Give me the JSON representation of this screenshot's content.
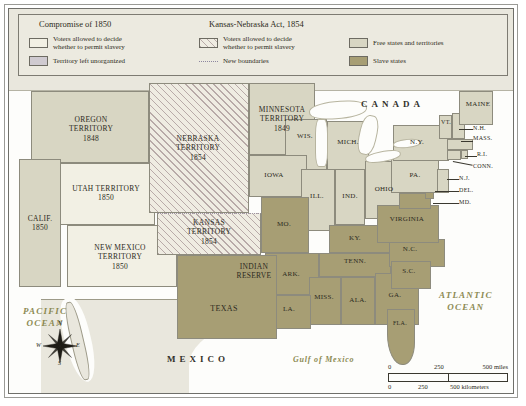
{
  "legend": {
    "titles": [
      {
        "text": "Compromise of 1850"
      },
      {
        "text": "Kansas-Nebraska Act, 1854"
      }
    ],
    "items": [
      {
        "label": "Voters allowed to decide\nwhether to permit slavery",
        "line1": "Voters allowed to decide",
        "line2": "whether to permit slavery",
        "swatch": "#f2f0e4",
        "group": "compromise"
      },
      {
        "label": "Territory left unorganized",
        "line1": "Territory left unorganized",
        "line2": "",
        "swatch": "#cfcad0",
        "group": "compromise"
      },
      {
        "label": "Voters allowed to decide\nwhether to permit slavery",
        "line1": "Voters allowed to decide",
        "line2": "whether to permit slavery",
        "swatch": "hatch",
        "group": "kansas-nebraska"
      },
      {
        "label": "New boundaries",
        "line1": "New boundaries",
        "line2": "",
        "swatch": "dashed",
        "group": "kansas-nebraska"
      },
      {
        "label": "Free states and territories",
        "line1": "Free states and territories",
        "line2": "",
        "swatch": "#d8d6c3",
        "group": "status"
      },
      {
        "label": "Slave states",
        "line1": "Slave states",
        "line2": "",
        "swatch": "#a79e74",
        "group": "status"
      }
    ]
  },
  "countries": [
    {
      "name": "CANADA"
    },
    {
      "name": "MEXICO"
    }
  ],
  "oceans": [
    {
      "line1": "PACIFIC",
      "line2": "OCEAN"
    },
    {
      "line1": "ATLANTIC",
      "line2": "OCEAN"
    },
    {
      "line1": "Gulf of Mexico",
      "line2": ""
    }
  ],
  "territories": [
    {
      "name": "OREGON TERRITORY",
      "line1": "OREGON",
      "line2": "TERRITORY",
      "year": "1848",
      "fill": "free"
    },
    {
      "name": "UTAH TERRITORY",
      "line1": "UTAH TERRITORY",
      "line2": "",
      "year": "1850",
      "fill": "voters"
    },
    {
      "name": "NEW MEXICO TERRITORY",
      "line1": "NEW MEXICO",
      "line2": "TERRITORY",
      "year": "1850",
      "fill": "voters"
    },
    {
      "name": "NEBRASKA TERRITORY",
      "line1": "NEBRASKA",
      "line2": "TERRITORY",
      "year": "1854",
      "fill": "hatch"
    },
    {
      "name": "KANSAS TERRITORY",
      "line1": "KANSAS",
      "line2": "TERRITORY",
      "year": "1854",
      "fill": "hatch"
    },
    {
      "name": "MINNESOTA TERRITORY",
      "line1": "MINNESOTA",
      "line2": "TERRITORY",
      "year": "1849",
      "fill": "free"
    },
    {
      "name": "INDIAN RESERVE",
      "line1": "INDIAN",
      "line2": "RESERVE",
      "year": "",
      "fill": "unorganized"
    }
  ],
  "states": [
    {
      "name": "CALIF.",
      "year": "1850",
      "fill": "free"
    },
    {
      "name": "TEXAS",
      "year": "",
      "fill": "slave"
    },
    {
      "name": "WIS.",
      "year": "",
      "fill": "free"
    },
    {
      "name": "MICH.",
      "year": "",
      "fill": "free"
    },
    {
      "name": "IOWA",
      "year": "",
      "fill": "free"
    },
    {
      "name": "ILL.",
      "year": "",
      "fill": "free"
    },
    {
      "name": "IND.",
      "year": "",
      "fill": "free"
    },
    {
      "name": "OHIO",
      "year": "",
      "fill": "free"
    },
    {
      "name": "MO.",
      "year": "",
      "fill": "slave"
    },
    {
      "name": "KY.",
      "year": "",
      "fill": "slave"
    },
    {
      "name": "TENN.",
      "year": "",
      "fill": "slave"
    },
    {
      "name": "ARK.",
      "year": "",
      "fill": "slave"
    },
    {
      "name": "MISS.",
      "year": "",
      "fill": "slave"
    },
    {
      "name": "ALA.",
      "year": "",
      "fill": "slave"
    },
    {
      "name": "GA.",
      "year": "",
      "fill": "slave"
    },
    {
      "name": "LA.",
      "year": "",
      "fill": "slave"
    },
    {
      "name": "FLA.",
      "year": "",
      "fill": "slave"
    },
    {
      "name": "N.C.",
      "year": "",
      "fill": "slave"
    },
    {
      "name": "S.C.",
      "year": "",
      "fill": "slave"
    },
    {
      "name": "VIRGINIA",
      "year": "",
      "fill": "slave"
    },
    {
      "name": "MD.",
      "year": "",
      "fill": "slave"
    },
    {
      "name": "DEL.",
      "year": "",
      "fill": "slave"
    },
    {
      "name": "PA.",
      "year": "",
      "fill": "free"
    },
    {
      "name": "N.J.",
      "year": "",
      "fill": "free"
    },
    {
      "name": "N.Y.",
      "year": "",
      "fill": "free"
    },
    {
      "name": "CONN.",
      "year": "",
      "fill": "free"
    },
    {
      "name": "R.I.",
      "year": "",
      "fill": "free"
    },
    {
      "name": "MASS.",
      "year": "",
      "fill": "free"
    },
    {
      "name": "N.H.",
      "year": "",
      "fill": "free"
    },
    {
      "name": "VT.",
      "year": "",
      "fill": "free"
    },
    {
      "name": "MAINE",
      "year": "",
      "fill": "free"
    }
  ],
  "scale": {
    "miles": {
      "ticks": [
        "0",
        "250",
        "500 miles"
      ]
    },
    "kilometers": {
      "ticks": [
        "0",
        "250",
        "500 kilometers"
      ]
    }
  },
  "compass": {
    "n": "N",
    "s": "S",
    "e": "E",
    "w": "W"
  },
  "colors": {
    "free": "#d8d6c3",
    "slave": "#a79e74",
    "voters": "#f2f0e4",
    "unorganized": "#cfcad0",
    "hatch_line": "#b8aaa8",
    "ocean": "#fdfdfb",
    "label": "#2c2a21",
    "ocean_label": "#8c8a52"
  }
}
